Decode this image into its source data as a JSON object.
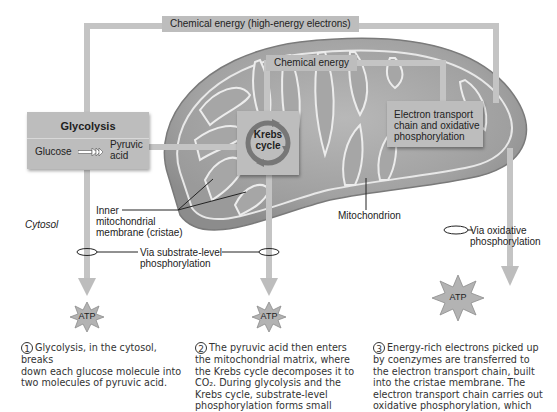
{
  "diagram": {
    "top_bar": {
      "label": "Chemical energy (high-energy electrons)"
    },
    "inner_bar": {
      "label": "Chemical energy"
    },
    "glycolysis": {
      "title": "Glycolysis",
      "input": "Glucose",
      "output_line1": "Pyruvic",
      "output_line2": "acid"
    },
    "krebs": {
      "line1": "Krebs",
      "line2": "cycle"
    },
    "etc": {
      "line1": "Electron transport",
      "line2": "chain and oxidative",
      "line3": "phosphorylation"
    },
    "labels": {
      "cytosol": "Cytosol",
      "inner_membrane_line1": "Inner",
      "inner_membrane_line2": "mitochondrial",
      "inner_membrane_line3": "membrane (cristae)",
      "mitochondrion": "Mitochondrion",
      "substrate_line1": "Via substrate-level",
      "substrate_line2": "phosphorylation",
      "oxidative_line1": "Via oxidative",
      "oxidative_line2": "phosphorylation"
    },
    "atp": [
      "ATP",
      "ATP",
      "ATP"
    ],
    "captions": [
      {
        "number": "1",
        "lines": [
          "Glycolysis, in the cytosol, breaks",
          "down each glucose molecule into",
          "two molecules of pyruvic acid."
        ]
      },
      {
        "number": "2",
        "lines": [
          "The pyruvic acid then enters",
          "the mitochondrial matrix, where",
          "the Krebs cycle decomposes it to",
          "CO₂. During glycolysis and the",
          "Krebs cycle, substrate-level",
          "phosphorylation forms small"
        ]
      },
      {
        "number": "3",
        "lines": [
          "Energy-rich electrons picked up",
          "by coenzymes are transferred to",
          "the electron transport chain, built",
          "into the cristae membrane. The",
          "electron transport chain carries out",
          "oxidative phosphorylation, which"
        ]
      }
    ],
    "colors": {
      "box_fill": "#bdbdbd",
      "pathway": "#c4c4c4",
      "mito_outer": "#8a8a8a",
      "mito_inner": "#a9a9a9",
      "atp_fill": "#b3b3b3"
    }
  }
}
